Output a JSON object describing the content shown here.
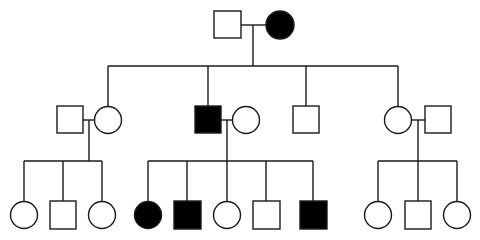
{
  "diagram": {
    "type": "pedigree",
    "legend": {
      "square": "male",
      "circle": "female",
      "filled": "affected",
      "open": "unaffected"
    },
    "colors": {
      "affected": "#000000",
      "unaffected": "#ffffff",
      "line": "#1a1a1a"
    },
    "generations": [
      {
        "id": "I",
        "individuals": [
          {
            "id": "I-1",
            "sex": "male",
            "affected": false
          },
          {
            "id": "I-2",
            "sex": "female",
            "affected": true
          }
        ],
        "couples": [
          [
            "I-1",
            "I-2"
          ]
        ]
      },
      {
        "id": "II",
        "individuals": [
          {
            "id": "II-1",
            "sex": "male",
            "affected": false,
            "married_in": true
          },
          {
            "id": "II-2",
            "sex": "female",
            "affected": false,
            "parents": [
              "I-1",
              "I-2"
            ]
          },
          {
            "id": "II-3",
            "sex": "male",
            "affected": true,
            "parents": [
              "I-1",
              "I-2"
            ]
          },
          {
            "id": "II-4",
            "sex": "female",
            "affected": false,
            "married_in": true
          },
          {
            "id": "II-5",
            "sex": "male",
            "affected": false,
            "parents": [
              "I-1",
              "I-2"
            ]
          },
          {
            "id": "II-6",
            "sex": "female",
            "affected": false,
            "parents": [
              "I-1",
              "I-2"
            ]
          },
          {
            "id": "II-7",
            "sex": "male",
            "affected": false,
            "married_in": true
          }
        ],
        "couples": [
          [
            "II-1",
            "II-2"
          ],
          [
            "II-3",
            "II-4"
          ],
          [
            "II-6",
            "II-7"
          ]
        ]
      },
      {
        "id": "III",
        "individuals": [
          {
            "id": "III-1",
            "sex": "female",
            "affected": false,
            "parents": [
              "II-1",
              "II-2"
            ]
          },
          {
            "id": "III-2",
            "sex": "male",
            "affected": false,
            "parents": [
              "II-1",
              "II-2"
            ]
          },
          {
            "id": "III-3",
            "sex": "female",
            "affected": false,
            "parents": [
              "II-1",
              "II-2"
            ]
          },
          {
            "id": "III-4",
            "sex": "female",
            "affected": true,
            "parents": [
              "II-3",
              "II-4"
            ]
          },
          {
            "id": "III-5",
            "sex": "male",
            "affected": true,
            "parents": [
              "II-3",
              "II-4"
            ]
          },
          {
            "id": "III-6",
            "sex": "female",
            "affected": false,
            "parents": [
              "II-3",
              "II-4"
            ]
          },
          {
            "id": "III-7",
            "sex": "male",
            "affected": false,
            "parents": [
              "II-3",
              "II-4"
            ]
          },
          {
            "id": "III-8",
            "sex": "male",
            "affected": true,
            "parents": [
              "II-3",
              "II-4"
            ]
          },
          {
            "id": "III-9",
            "sex": "female",
            "affected": false,
            "parents": [
              "II-6",
              "II-7"
            ]
          },
          {
            "id": "III-10",
            "sex": "male",
            "affected": false,
            "parents": [
              "II-6",
              "II-7"
            ]
          },
          {
            "id": "III-11",
            "sex": "female",
            "affected": false,
            "parents": [
              "II-6",
              "II-7"
            ]
          }
        ]
      }
    ]
  }
}
